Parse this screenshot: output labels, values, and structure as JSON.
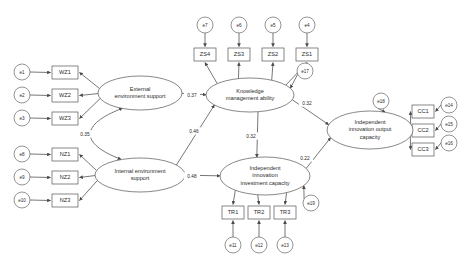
{
  "diagram": {
    "type": "sem-path-diagram",
    "colors": {
      "stroke": "#4a4a4a",
      "node_stroke": "#555555",
      "text": "#2b2b2b",
      "background": "#ffffff"
    }
  },
  "latents": [
    {
      "id": "ees",
      "label_lines": [
        "External",
        "environment support"
      ],
      "cx": 140,
      "cy": 93,
      "rx": 42,
      "ry": 17
    },
    {
      "id": "ies",
      "label_lines": [
        "Internal environment",
        "support"
      ],
      "cx": 140,
      "cy": 175,
      "rx": 45,
      "ry": 17
    },
    {
      "id": "kma",
      "label_lines": [
        "Knowledge",
        "management ability"
      ],
      "cx": 250,
      "cy": 95,
      "rx": 44,
      "ry": 17
    },
    {
      "id": "iiic",
      "label_lines": [
        "Independent",
        "innovation",
        "investment capacity"
      ],
      "cx": 265,
      "cy": 176,
      "rx": 45,
      "ry": 19
    },
    {
      "id": "iioc",
      "label_lines": [
        "Independent",
        "innovation output",
        "capacity"
      ],
      "cx": 370,
      "cy": 130,
      "rx": 43,
      "ry": 19
    }
  ],
  "indicators": [
    {
      "id": "WZ1",
      "label": "WZ1",
      "x": 52,
      "y": 66,
      "w": 26,
      "h": 13
    },
    {
      "id": "WZ2",
      "label": "WZ2",
      "x": 52,
      "y": 89,
      "w": 26,
      "h": 13
    },
    {
      "id": "WZ3",
      "label": "WZ3",
      "x": 52,
      "y": 112,
      "w": 26,
      "h": 13
    },
    {
      "id": "NZ1",
      "label": "NZ1",
      "x": 52,
      "y": 148,
      "w": 26,
      "h": 13
    },
    {
      "id": "NZ2",
      "label": "NZ2",
      "x": 52,
      "y": 171,
      "w": 26,
      "h": 13
    },
    {
      "id": "NZ3",
      "label": "NZ3",
      "x": 52,
      "y": 194,
      "w": 26,
      "h": 13
    },
    {
      "id": "ZS4",
      "label": "ZS4",
      "x": 194,
      "y": 48,
      "w": 22,
      "h": 13
    },
    {
      "id": "ZS3",
      "label": "ZS3",
      "x": 228,
      "y": 48,
      "w": 22,
      "h": 13
    },
    {
      "id": "ZS2",
      "label": "ZS2",
      "x": 262,
      "y": 48,
      "w": 22,
      "h": 13
    },
    {
      "id": "ZS1",
      "label": "ZS1",
      "x": 296,
      "y": 48,
      "w": 22,
      "h": 13
    },
    {
      "id": "TR1",
      "label": "TR1",
      "x": 222,
      "y": 206,
      "w": 22,
      "h": 13
    },
    {
      "id": "TR2",
      "label": "TR2",
      "x": 248,
      "y": 206,
      "w": 22,
      "h": 13
    },
    {
      "id": "TR3",
      "label": "TR3",
      "x": 274,
      "y": 206,
      "w": 22,
      "h": 13
    },
    {
      "id": "CC1",
      "label": "CC1",
      "x": 412,
      "y": 105,
      "w": 22,
      "h": 13
    },
    {
      "id": "CC2",
      "label": "CC2",
      "x": 412,
      "y": 124,
      "w": 22,
      "h": 13
    },
    {
      "id": "CC3",
      "label": "CC3",
      "x": 412,
      "y": 143,
      "w": 22,
      "h": 13
    }
  ],
  "errors": [
    {
      "id": "e1",
      "label": "e1",
      "cx": 22,
      "cy": 72,
      "r": 8
    },
    {
      "id": "e2",
      "label": "e2",
      "cx": 22,
      "cy": 95,
      "r": 8
    },
    {
      "id": "e3",
      "label": "e3",
      "cx": 22,
      "cy": 118,
      "r": 8
    },
    {
      "id": "e8",
      "label": "e8",
      "cx": 22,
      "cy": 154,
      "r": 8
    },
    {
      "id": "e9",
      "label": "e9",
      "cx": 22,
      "cy": 177,
      "r": 8
    },
    {
      "id": "e10",
      "label": "e10",
      "cx": 22,
      "cy": 200,
      "r": 8
    },
    {
      "id": "e7",
      "label": "e7",
      "cx": 205,
      "cy": 25,
      "r": 8
    },
    {
      "id": "e6",
      "label": "e6",
      "cx": 239,
      "cy": 25,
      "r": 8
    },
    {
      "id": "e5",
      "label": "e5",
      "cx": 273,
      "cy": 25,
      "r": 8
    },
    {
      "id": "e4",
      "label": "e4",
      "cx": 307,
      "cy": 25,
      "r": 8
    },
    {
      "id": "e17",
      "label": "e17",
      "cx": 305,
      "cy": 71,
      "r": 8
    },
    {
      "id": "e18",
      "label": "e18",
      "cx": 381,
      "cy": 101,
      "r": 8
    },
    {
      "id": "e19",
      "label": "e19",
      "cx": 311,
      "cy": 203,
      "r": 8
    },
    {
      "id": "e11",
      "label": "e11",
      "cx": 233,
      "cy": 245,
      "r": 8
    },
    {
      "id": "e12",
      "label": "e12",
      "cx": 259,
      "cy": 245,
      "r": 8
    },
    {
      "id": "e13",
      "label": "e13",
      "cx": 285,
      "cy": 245,
      "r": 8
    },
    {
      "id": "e14",
      "label": "e14",
      "cx": 449,
      "cy": 105,
      "r": 8
    },
    {
      "id": "e15",
      "label": "e15",
      "cx": 449,
      "cy": 124,
      "r": 8
    },
    {
      "id": "e16",
      "label": "e16",
      "cx": 449,
      "cy": 143,
      "r": 8
    }
  ],
  "coefficients": [
    {
      "id": "ees-to-kma",
      "value": "0.37",
      "x": 192,
      "y": 95,
      "from": "External environment support",
      "to": "Knowledge management ability"
    },
    {
      "id": "ies-to-kma",
      "value": "0.46",
      "x": 194,
      "y": 131,
      "from": "Internal environment support",
      "to": "Knowledge management ability"
    },
    {
      "id": "ees-ies-corr",
      "value": "0.35",
      "x": 85,
      "y": 134,
      "from": "External environment support",
      "to": "Internal environment support"
    },
    {
      "id": "ies-to-iiic",
      "value": "0.48",
      "x": 192,
      "y": 176,
      "from": "Internal environment support",
      "to": "Independent innovation investment capacity"
    },
    {
      "id": "kma-to-iiic",
      "value": "0.32",
      "x": 251,
      "y": 136,
      "from": "Knowledge management ability",
      "to": "Independent innovation investment capacity"
    },
    {
      "id": "kma-to-iioc",
      "value": "0.32",
      "x": 307,
      "y": 103,
      "from": "Knowledge management ability",
      "to": "Independent innovation output capacity"
    },
    {
      "id": "iiic-to-iioc",
      "value": "0.22",
      "x": 305,
      "y": 158,
      "from": "Independent innovation investment capacity",
      "to": "Independent innovation output capacity"
    }
  ]
}
